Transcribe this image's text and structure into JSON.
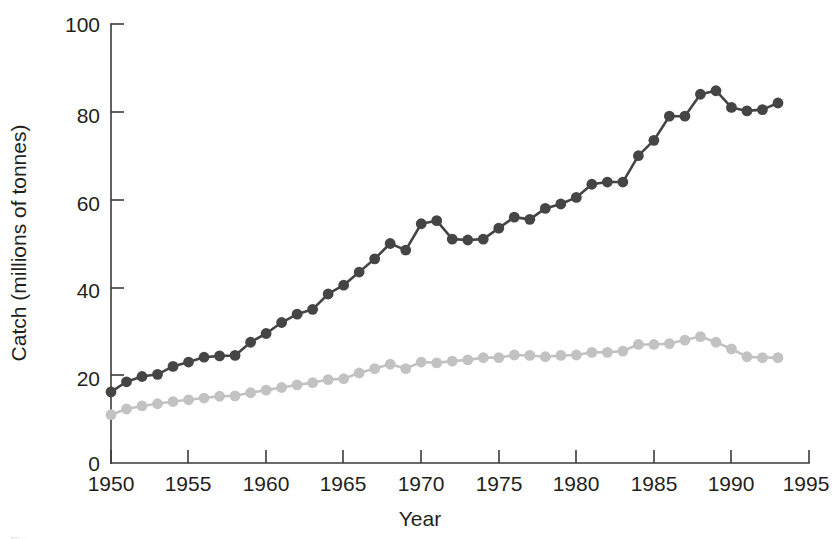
{
  "chart_data": {
    "type": "line",
    "title": "",
    "xlabel": "Year",
    "ylabel": "Catch (millions of tonnes)",
    "xlim": [
      1950,
      1995
    ],
    "ylim": [
      0,
      100
    ],
    "xticks": [
      1950,
      1955,
      1960,
      1965,
      1970,
      1975,
      1980,
      1985,
      1990,
      1995
    ],
    "yticks": [
      0,
      20,
      40,
      60,
      80,
      100
    ],
    "grid": false,
    "legend": "none",
    "x": [
      1950,
      1951,
      1952,
      1953,
      1954,
      1955,
      1956,
      1957,
      1958,
      1959,
      1960,
      1961,
      1962,
      1963,
      1964,
      1965,
      1966,
      1967,
      1968,
      1969,
      1970,
      1971,
      1972,
      1973,
      1974,
      1975,
      1976,
      1977,
      1978,
      1979,
      1980,
      1981,
      1982,
      1983,
      1984,
      1985,
      1986,
      1987,
      1988,
      1989,
      1990,
      1991,
      1992,
      1993
    ],
    "series": [
      {
        "name": "total-catch",
        "color": "#454545",
        "marker": "filled-circle",
        "values": [
          16.2,
          18.5,
          19.7,
          20.2,
          22.0,
          23.0,
          24.1,
          24.4,
          24.5,
          27.5,
          29.5,
          32.0,
          33.9,
          35.0,
          38.5,
          40.5,
          43.5,
          46.5,
          50.0,
          48.5,
          54.5,
          55.2,
          51.0,
          50.8,
          51.0,
          53.5,
          56.0,
          55.5,
          58.0,
          59.0,
          60.5,
          63.5,
          64.0,
          64.0,
          70.0,
          73.5,
          79.0,
          79.0,
          84.0,
          84.8,
          81.0,
          80.2,
          80.5,
          82.0
        ]
      },
      {
        "name": "food-fish-catch",
        "color": "#c2c2c2",
        "marker": "filled-circle",
        "values": [
          11.0,
          12.3,
          13.0,
          13.5,
          14.0,
          14.4,
          14.8,
          15.2,
          15.3,
          16.0,
          16.6,
          17.2,
          17.8,
          18.3,
          19.0,
          19.2,
          20.5,
          21.5,
          22.5,
          21.5,
          23.0,
          22.8,
          23.2,
          23.5,
          24.0,
          24.0,
          24.6,
          24.5,
          24.2,
          24.5,
          24.6,
          25.2,
          25.2,
          25.5,
          27.0,
          27.0,
          27.2,
          28.0,
          28.8,
          27.5,
          26.0,
          24.2,
          24.0,
          24.0
        ]
      }
    ]
  },
  "axes": {
    "y_title": "Catch (millions of tonnes)",
    "x_title": "Year",
    "y_tick_labels": [
      "0",
      "20",
      "40",
      "60",
      "80",
      "100"
    ],
    "x_tick_labels": [
      "1950",
      "1955",
      "1960",
      "1965",
      "1970",
      "1975",
      "1980",
      "1985",
      "1990",
      "1995"
    ]
  },
  "colors": {
    "axis": "#3a3a3a",
    "text": "#231f20",
    "series_dark": "#454545",
    "series_light": "#c2c2c2",
    "background": "#ffffff"
  },
  "footer": {
    "partial_caption": "Figure"
  }
}
